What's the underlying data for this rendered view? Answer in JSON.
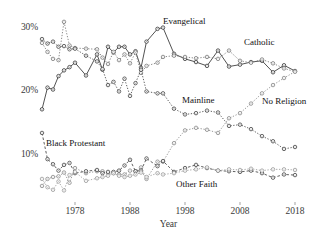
{
  "chart_data": {
    "type": "line",
    "title": "",
    "xlabel": "Year",
    "ylabel": "",
    "xlim": [
      1972,
      2018
    ],
    "ylim": [
      3.0,
      31.5
    ],
    "grid": false,
    "legend_position": "inline-labels",
    "xticks": [
      1978,
      1988,
      1998,
      2008,
      2018
    ],
    "xticklabels": [
      "1978",
      "1988",
      "1998",
      "2008",
      "2018"
    ],
    "yticks": [
      10,
      20,
      30
    ],
    "yticklabels": [
      "10%",
      "20%",
      "30%"
    ],
    "marker": "open-circle",
    "series": [
      {
        "name": "Evangelical",
        "label": "Evangelical",
        "style": "solid",
        "color": "#333333",
        "x": [
          1972,
          1973,
          1974,
          1975,
          1976,
          1977,
          1978,
          1980,
          1982,
          1983,
          1984,
          1985,
          1986,
          1987,
          1988,
          1989,
          1990,
          1991,
          1993,
          1994,
          1996,
          1998,
          2000,
          2002,
          2004,
          2006,
          2008,
          2010,
          2012,
          2014,
          2016,
          2018
        ],
        "values": [
          17.2,
          20.6,
          20.3,
          22.4,
          23.3,
          23.8,
          24.5,
          22.5,
          25.8,
          23.4,
          27.0,
          26.1,
          27.0,
          27.0,
          25.8,
          26.3,
          23.7,
          27.8,
          29.8,
          30.0,
          25.9,
          25.1,
          24.6,
          24.0,
          26.4,
          23.9,
          24.2,
          24.6,
          24.8,
          23.0,
          24.1,
          23.2
        ]
      },
      {
        "name": "Catholic",
        "label": "Catholic",
        "style": "dotted",
        "color": "#777777",
        "x": [
          1972,
          1973,
          1974,
          1975,
          1976,
          1977,
          1978,
          1980,
          1982,
          1983,
          1984,
          1985,
          1986,
          1987,
          1988,
          1989,
          1990,
          1991,
          1993,
          1994,
          1996,
          1998,
          2000,
          2002,
          2004,
          2006,
          2008,
          2010,
          2012,
          2014,
          2016,
          2018
        ],
        "values": [
          27.6,
          26.2,
          25.1,
          24.9,
          30.9,
          27.2,
          26.8,
          26.7,
          26.6,
          25.3,
          24.3,
          26.2,
          24.9,
          25.8,
          24.4,
          26.1,
          22.9,
          24.0,
          24.5,
          25.4,
          25.6,
          25.4,
          25.2,
          25.4,
          25.1,
          26.4,
          24.8,
          24.5,
          25.0,
          24.4,
          23.6,
          23.1
        ]
      },
      {
        "name": "Mainline",
        "label": "Mainline",
        "style": "dotted",
        "color": "#444444",
        "x": [
          1972,
          1973,
          1974,
          1975,
          1976,
          1977,
          1978,
          1980,
          1982,
          1983,
          1984,
          1985,
          1986,
          1987,
          1988,
          1989,
          1990,
          1991,
          1993,
          1994,
          1996,
          1998,
          2000,
          2002,
          2004,
          2006,
          2008,
          2010,
          2012,
          2014,
          2016,
          2018
        ],
        "values": [
          28.2,
          27.5,
          27.8,
          27.0,
          27.1,
          26.6,
          26.7,
          25.6,
          24.7,
          23.5,
          21.0,
          21.5,
          20.0,
          22.0,
          19.3,
          21.3,
          23.4,
          20.0,
          19.7,
          19.7,
          17.3,
          16.4,
          16.6,
          17.0,
          16.7,
          14.6,
          14.8,
          14.1,
          13.0,
          12.2,
          11.0,
          11.3
        ]
      },
      {
        "name": "No Religion",
        "label": "No Religion",
        "style": "dotted",
        "color": "#888888",
        "x": [
          1972,
          1973,
          1974,
          1975,
          1976,
          1977,
          1978,
          1980,
          1982,
          1983,
          1984,
          1985,
          1986,
          1987,
          1988,
          1989,
          1990,
          1991,
          1993,
          1994,
          1996,
          1998,
          2000,
          2002,
          2004,
          2006,
          2008,
          2010,
          2012,
          2014,
          2016,
          2018
        ],
        "values": [
          5.2,
          6.3,
          6.6,
          6.7,
          7.3,
          5.7,
          8.0,
          7.2,
          7.5,
          7.5,
          7.2,
          7.2,
          7.0,
          7.0,
          7.6,
          7.5,
          8.1,
          6.3,
          9.0,
          9.0,
          11.9,
          13.9,
          14.3,
          14.0,
          13.5,
          15.8,
          16.6,
          18.1,
          19.7,
          21.0,
          22.1,
          23.1
        ]
      },
      {
        "name": "Black Protestant",
        "label": "Black Protestant",
        "style": "dashed",
        "color": "#444444",
        "x": [
          1972,
          1973,
          1974,
          1975,
          1976,
          1977,
          1978,
          1980,
          1982,
          1983,
          1984,
          1985,
          1986,
          1987,
          1988,
          1989,
          1990,
          1991,
          1993,
          1994,
          1996,
          1998,
          2000,
          2002,
          2004,
          2006,
          2008,
          2010,
          2012,
          2014,
          2016,
          2018
        ],
        "values": [
          13.5,
          9.4,
          8.6,
          7.6,
          8.5,
          8.8,
          7.2,
          7.5,
          7.7,
          7.2,
          7.4,
          7.4,
          7.6,
          8.4,
          9.3,
          7.5,
          7.6,
          9.5,
          8.3,
          9.1,
          7.4,
          8.0,
          8.5,
          8.0,
          7.6,
          7.5,
          7.4,
          7.6,
          7.2,
          6.5,
          7.0,
          6.9
        ]
      },
      {
        "name": "Other Faith",
        "label": "Other Faith",
        "style": "dotted",
        "color": "#999999",
        "x": [
          1972,
          1973,
          1974,
          1975,
          1976,
          1977,
          1978,
          1980,
          1982,
          1983,
          1984,
          1985,
          1986,
          1987,
          1988,
          1989,
          1990,
          1991,
          1993,
          1994,
          1996,
          1998,
          2000,
          2002,
          2004,
          2006,
          2008,
          2010,
          2012,
          2014,
          2016,
          2018
        ],
        "values": [
          6.3,
          5.0,
          4.6,
          5.9,
          4.5,
          6.9,
          7.4,
          6.0,
          6.4,
          6.6,
          6.8,
          7.2,
          6.8,
          6.6,
          6.8,
          7.0,
          7.3,
          6.6,
          7.2,
          7.0,
          7.2,
          7.6,
          7.8,
          8.1,
          7.6,
          7.8,
          7.7,
          7.9,
          7.6,
          7.8,
          7.8,
          7.7
        ]
      }
    ],
    "annotations": [
      {
        "text": "Evangelical",
        "x_px": 163,
        "y_px": 16
      },
      {
        "text": "Catholic",
        "x_px": 244,
        "y_px": 37
      },
      {
        "text": "Mainline",
        "x_px": 182,
        "y_px": 95
      },
      {
        "text": "No Religion",
        "x_px": 262,
        "y_px": 96
      },
      {
        "text": "Black Protestant",
        "x_px": 46,
        "y_px": 138
      },
      {
        "text": "Other Faith",
        "x_px": 176,
        "y_px": 179
      }
    ]
  }
}
